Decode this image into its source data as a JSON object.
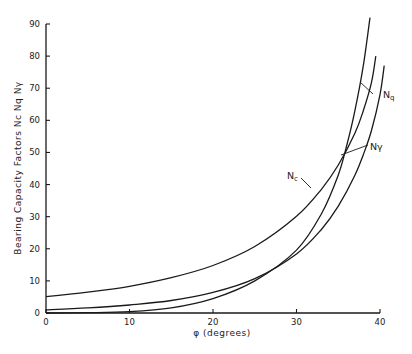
{
  "chart_data": {
    "type": "line",
    "title": "",
    "xlabel": "φ (degrees)",
    "ylabel": "Bearing Capacity Factors  Nc  Nq  Nγ",
    "xlim": [
      0,
      40
    ],
    "ylim": [
      0,
      90
    ],
    "x_ticks": [
      0,
      10,
      20,
      30,
      40
    ],
    "y_ticks": [
      0,
      10,
      20,
      30,
      40,
      50,
      60,
      70,
      80,
      90
    ],
    "grid": false,
    "legend": "inline labels with leader lines",
    "series": [
      {
        "name": "Nc",
        "label": "Nc",
        "x": [
          0,
          5,
          10,
          15,
          20,
          25,
          30,
          33,
          35,
          37,
          38,
          39,
          39.5
        ],
        "values": [
          5.1,
          6.5,
          8.3,
          11.0,
          14.8,
          20.7,
          30.1,
          38.6,
          46.1,
          56.0,
          63.0,
          72.0,
          80.0
        ]
      },
      {
        "name": "Nq",
        "label": "Nq",
        "x": [
          0,
          5,
          10,
          15,
          20,
          25,
          30,
          33,
          35,
          37,
          38,
          39,
          40,
          40.5
        ],
        "values": [
          1.0,
          1.6,
          2.5,
          3.9,
          6.4,
          10.7,
          18.4,
          26.1,
          33.3,
          42.9,
          49.3,
          57.0,
          68.0,
          77.0
        ]
      },
      {
        "name": "Nγ",
        "label": "Nγ",
        "x": [
          0,
          5,
          10,
          15,
          20,
          25,
          30,
          33,
          35,
          36,
          37,
          38,
          38.8
        ],
        "values": [
          0,
          0.1,
          0.4,
          1.6,
          4.5,
          10.0,
          19.6,
          31.0,
          43.0,
          52.0,
          63.0,
          77.0,
          92.0
        ]
      }
    ],
    "annotations": [
      {
        "text": "Nc",
        "points_to": "Nc",
        "at_phi": 31.5
      },
      {
        "text": "Nq",
        "points_to": "Nq",
        "at_phi": 38.5
      },
      {
        "text": "Nγ",
        "points_to": "Nγ",
        "at_phi": 36.5
      }
    ]
  },
  "labels": {
    "x_axis": "φ (degrees)",
    "y_axis": "Bearing Capacity Factors  Nc  Nq  Nγ",
    "nc": "N",
    "nc_sub": "c",
    "nq": "N",
    "nq_sub": "q",
    "ngamma": "Nγ"
  },
  "style": {
    "line_color": "#1a1a1a",
    "background": "#ffffff"
  }
}
